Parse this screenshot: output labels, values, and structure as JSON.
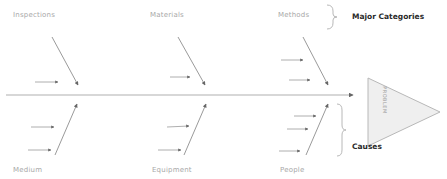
{
  "diagram": {
    "type": "fishbone",
    "head_label": "PROBLEM",
    "annotations": {
      "major_categories": "Major Categories",
      "causes": "Causes"
    },
    "top_categories": [
      {
        "label": "Inspections"
      },
      {
        "label": "Materials"
      },
      {
        "label": "Methods"
      }
    ],
    "bottom_categories": [
      {
        "label": "Medium"
      },
      {
        "label": "Equipment"
      },
      {
        "label": "People"
      }
    ],
    "colors": {
      "line": "#9a9a9a",
      "spine": "#b0b0b0",
      "head_fill": "#efefef",
      "head_stroke": "#b8b8b8",
      "category_text": "#a8a8a8",
      "annotation_text": "#2a2a2a"
    }
  }
}
